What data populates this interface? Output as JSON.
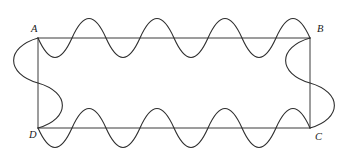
{
  "figure": {
    "background_color": "#ffffff",
    "line_color": "#3a3a3a",
    "curve_color": "#2e2e2e",
    "label_color": "#1a1a1a",
    "rectangle": {
      "left": 38,
      "top": 38,
      "right": 310,
      "bottom": 128,
      "width": 272,
      "height": 90
    },
    "corners": [
      {
        "id": "A",
        "label": "A",
        "x": 38,
        "y": 38,
        "label_x": 31,
        "label_y": 30,
        "position": "top-left"
      },
      {
        "id": "B",
        "label": "B",
        "x": 310,
        "y": 38,
        "label_x": 317,
        "label_y": 30,
        "position": "top-right"
      },
      {
        "id": "C",
        "label": "C",
        "x": 310,
        "y": 128,
        "label_x": 315,
        "label_y": 138,
        "position": "bottom-right"
      },
      {
        "id": "D",
        "label": "D",
        "x": 38,
        "y": 128,
        "label_x": 29,
        "label_y": 136,
        "position": "bottom-left"
      }
    ],
    "edges": [
      {
        "id": "AB",
        "name": "top-edge",
        "from": "A",
        "to": "B",
        "orientation": "horizontal",
        "axis": 38,
        "start": 38,
        "end": 310,
        "wave_type": "sine",
        "periods": 4,
        "period_length": 68,
        "amplitude": 22,
        "first_lobe": "below"
      },
      {
        "id": "DC",
        "name": "bottom-edge",
        "from": "D",
        "to": "C",
        "orientation": "horizontal",
        "axis": 128,
        "start": 38,
        "end": 310,
        "wave_type": "sine",
        "periods": 4,
        "period_length": 68,
        "amplitude": 22,
        "first_lobe": "below"
      },
      {
        "id": "AD",
        "name": "left-edge",
        "from": "A",
        "to": "D",
        "orientation": "vertical",
        "axis": 38,
        "start": 38,
        "end": 128,
        "wave_type": "s-curve",
        "periods": 1,
        "period_length": 90,
        "amplitude": 25,
        "first_lobe": "outward"
      },
      {
        "id": "BC",
        "name": "right-edge",
        "from": "B",
        "to": "C",
        "orientation": "vertical",
        "axis": 310,
        "start": 38,
        "end": 128,
        "wave_type": "s-curve",
        "periods": 1,
        "period_length": 90,
        "amplitude": 25,
        "first_lobe": "inward"
      }
    ]
  }
}
